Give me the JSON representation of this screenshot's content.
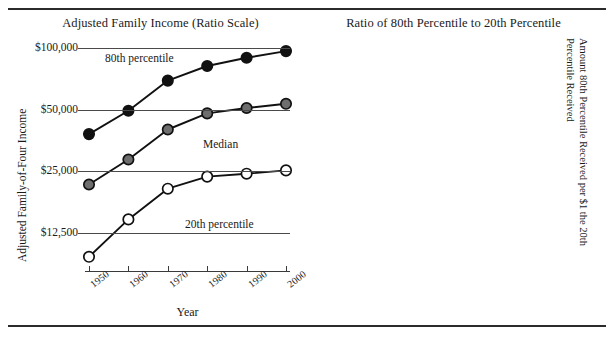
{
  "figure": {
    "left_panel": {
      "title": "Adjusted Family Income (Ratio Scale)",
      "y_axis_title": "Adjusted Family-of-Four Income",
      "x_axis_title": "Year",
      "y_ticks": [
        "$100,000",
        "$50,000",
        "$25,000",
        "$12,500"
      ],
      "x_ticks": [
        "1950",
        "1960",
        "1970",
        "1980",
        "1990",
        "2000"
      ],
      "annotations": [
        "80th percentile",
        "Median",
        "20th percentile"
      ]
    },
    "right_panel": {
      "title": "Ratio of 80th Percentile to 20th Percentile",
      "y_axis_title": "Amount 80th Percentile Received per $1 the 20th Percentile Received",
      "x_axis_title": "Year",
      "y_ticks": [
        "$4.00",
        "$3.50",
        "$3.00",
        "$2.50",
        "$2.00"
      ],
      "x_ticks": [
        "1950",
        "1960",
        "1970",
        "1980",
        "1990",
        "2000"
      ]
    },
    "colors": {
      "p80_marker": "#111111",
      "median_marker": "#6e6e6e",
      "p20_marker": "#ffffff",
      "ratio_marker": "#6e6e6e",
      "line": "#111111",
      "gridline": "#4a4a4a",
      "text": "#1a1a1a"
    }
  },
  "chart_data": [
    {
      "type": "line",
      "title": "Adjusted Family Income (Ratio Scale)",
      "xlabel": "Year",
      "ylabel": "Adjusted Family-of-Four Income",
      "yscale": "log",
      "ylim": [
        8000,
        110000
      ],
      "ytick_values": [
        100000,
        50000,
        25000,
        12500
      ],
      "ytick_labels": [
        "$100,000",
        "$50,000",
        "$25,000",
        "$12,500"
      ],
      "x": [
        1950,
        1960,
        1970,
        1980,
        1990,
        2000
      ],
      "grid": true,
      "legend": "inline-annotations",
      "series": [
        {
          "name": "80th percentile",
          "marker": "filled-black-circle",
          "values": [
            38000,
            49500,
            69500,
            82000,
            90000,
            97000
          ]
        },
        {
          "name": "Median",
          "marker": "filled-gray-circle",
          "values": [
            21500,
            28500,
            40000,
            48000,
            51000,
            53500
          ]
        },
        {
          "name": "20th percentile",
          "marker": "open-circle",
          "values": [
            9500,
            14500,
            20500,
            23500,
            24300,
            25200
          ]
        }
      ]
    },
    {
      "type": "line",
      "title": "Ratio of 80th Percentile to 20th Percentile",
      "xlabel": "Year",
      "ylabel": "Amount 80th Percentile Received per $1 the 20th Percentile Received",
      "yscale": "linear",
      "ylim": [
        2.0,
        4.0
      ],
      "ytick_values": [
        4.0,
        3.5,
        3.0,
        2.5,
        2.0
      ],
      "ytick_labels": [
        "$4.00",
        "$3.50",
        "$3.00",
        "$2.50",
        "$2.00"
      ],
      "x": [
        1950,
        1960,
        1970,
        1980,
        1990,
        2000
      ],
      "grid": true,
      "series": [
        {
          "name": "80th / 20th percentile ratio",
          "marker": "filled-gray-circle",
          "values": [
            4.0,
            3.35,
            3.19,
            3.35,
            3.62,
            3.71
          ]
        }
      ]
    }
  ]
}
